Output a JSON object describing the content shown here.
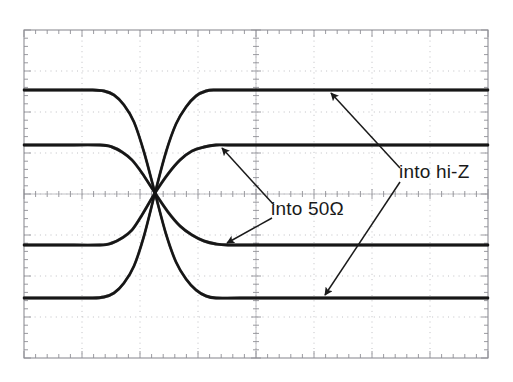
{
  "figure": {
    "kind": "oscilloscope-screenshot",
    "background_color": "#ffffff",
    "trace_color": "#141414",
    "grid_color": "#b9b9bd",
    "grid_border_color": "#8f8f95",
    "annotation_color": "#1a1a1a"
  },
  "graticule": {
    "left": 24,
    "top": 30,
    "right": 488,
    "bottom": 358,
    "divisions_x": 8,
    "divisions_y": 8,
    "minor_ticks_per_division": 5,
    "center_x": 256,
    "center_y": 194
  },
  "annotations": [
    {
      "id": "into-50ohm",
      "text": "into 50Ω",
      "x": 271,
      "y": 199,
      "arrows": [
        {
          "from_x": 274,
          "from_y": 205,
          "to_x": 222,
          "to_y": 148
        },
        {
          "from_x": 272,
          "from_y": 218,
          "to_x": 227,
          "to_y": 243
        }
      ]
    },
    {
      "id": "into-hi-z",
      "text": "into hi-Z",
      "x": 399,
      "y": 162,
      "arrows": [
        {
          "from_x": 400,
          "from_y": 168,
          "to_x": 331,
          "to_y": 93
        },
        {
          "from_x": 400,
          "from_y": 182,
          "to_x": 325,
          "to_y": 295
        }
      ]
    }
  ],
  "chart_data": {
    "type": "line",
    "title": "",
    "xlabel": "",
    "ylabel": "",
    "xlim": [
      0,
      8
    ],
    "ylim": [
      0,
      8
    ],
    "grid": true,
    "legend": "annotations",
    "units": {
      "x": "divisions (time)",
      "y": "divisions (voltage)"
    },
    "crossing_point": {
      "x_px": 155,
      "y_px": 193
    },
    "series": [
      {
        "name": "hi-Z falling edge",
        "label": "into hi-Z",
        "level_high_px": 90,
        "level_low_px": 298,
        "edge": "falling",
        "edge_start_px": 98,
        "edge_end_px": 212,
        "points_px": [
          [
            24,
            90
          ],
          [
            60,
            90
          ],
          [
            92,
            90
          ],
          [
            104,
            91
          ],
          [
            114,
            95
          ],
          [
            124,
            105
          ],
          [
            134,
            122
          ],
          [
            144,
            152
          ],
          [
            155,
            193
          ],
          [
            166,
            234
          ],
          [
            176,
            262
          ],
          [
            186,
            279
          ],
          [
            196,
            290
          ],
          [
            206,
            296
          ],
          [
            216,
            298
          ],
          [
            240,
            298
          ],
          [
            300,
            298
          ],
          [
            380,
            298
          ],
          [
            440,
            298
          ],
          [
            488,
            298
          ]
        ]
      },
      {
        "name": "hi-Z rising edge",
        "label": "into hi-Z",
        "level_high_px": 90,
        "level_low_px": 298,
        "edge": "rising",
        "edge_start_px": 98,
        "edge_end_px": 212,
        "points_px": [
          [
            24,
            298
          ],
          [
            60,
            298
          ],
          [
            92,
            298
          ],
          [
            104,
            297
          ],
          [
            114,
            293
          ],
          [
            124,
            283
          ],
          [
            134,
            266
          ],
          [
            144,
            236
          ],
          [
            155,
            193
          ],
          [
            166,
            152
          ],
          [
            176,
            124
          ],
          [
            186,
            107
          ],
          [
            196,
            96
          ],
          [
            206,
            91
          ],
          [
            216,
            90
          ],
          [
            240,
            90
          ],
          [
            300,
            90
          ],
          [
            380,
            90
          ],
          [
            440,
            90
          ],
          [
            488,
            90
          ]
        ]
      },
      {
        "name": "50 ohm falling edge",
        "label": "into 50Ω",
        "level_high_px": 145,
        "level_low_px": 245,
        "edge": "falling",
        "edge_start_px": 106,
        "edge_end_px": 225,
        "points_px": [
          [
            24,
            145
          ],
          [
            60,
            145
          ],
          [
            100,
            145
          ],
          [
            112,
            147
          ],
          [
            122,
            152
          ],
          [
            132,
            160
          ],
          [
            142,
            173
          ],
          [
            155,
            193
          ],
          [
            168,
            212
          ],
          [
            180,
            226
          ],
          [
            192,
            235
          ],
          [
            204,
            241
          ],
          [
            216,
            244
          ],
          [
            228,
            245
          ],
          [
            260,
            245
          ],
          [
            320,
            245
          ],
          [
            400,
            245
          ],
          [
            488,
            245
          ]
        ]
      },
      {
        "name": "50 ohm rising edge",
        "label": "into 50Ω",
        "level_high_px": 145,
        "level_low_px": 245,
        "edge": "rising",
        "edge_start_px": 106,
        "edge_end_px": 225,
        "points_px": [
          [
            24,
            245
          ],
          [
            60,
            245
          ],
          [
            100,
            245
          ],
          [
            112,
            243
          ],
          [
            122,
            238
          ],
          [
            132,
            230
          ],
          [
            142,
            215
          ],
          [
            155,
            193
          ],
          [
            168,
            174
          ],
          [
            180,
            160
          ],
          [
            192,
            151
          ],
          [
            204,
            147
          ],
          [
            216,
            145
          ],
          [
            228,
            145
          ],
          [
            260,
            145
          ],
          [
            320,
            145
          ],
          [
            400,
            145
          ],
          [
            488,
            145
          ]
        ]
      }
    ]
  }
}
